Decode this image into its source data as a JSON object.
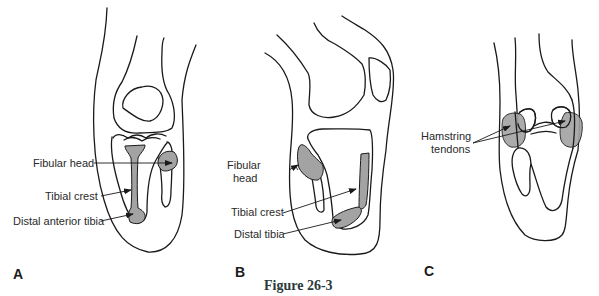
{
  "figure": {
    "caption": "Figure 26-3",
    "colors": {
      "outline": "#1a1a1a",
      "shaded_region": "#a3a3a3",
      "background": "#ffffff"
    },
    "panels": [
      {
        "letter": "A",
        "view": "anterior knee",
        "labels": [
          "Fibular head",
          "Tibial crest",
          "Distal anterior tibia"
        ]
      },
      {
        "letter": "B",
        "view": "lateral knee",
        "labels": [
          "Fibular",
          "head",
          "Tibial crest",
          "Distal tibia"
        ]
      },
      {
        "letter": "C",
        "view": "posterior knee",
        "labels": [
          "Hamstring",
          "tendons"
        ]
      }
    ]
  }
}
